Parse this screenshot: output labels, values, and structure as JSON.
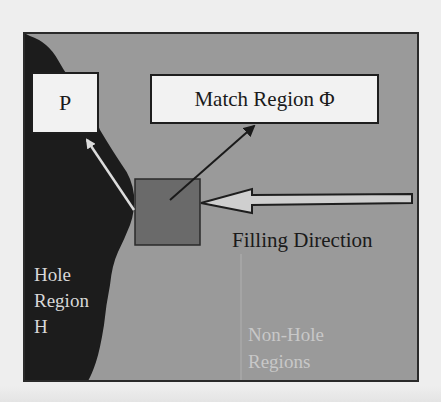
{
  "diagram": {
    "labels": {
      "patch_p": "P",
      "match_region": "Match Region Φ",
      "filling_direction": "Filling Direction",
      "hole_region": [
        "Hole",
        "Region",
        "H"
      ],
      "non_hole_regions": [
        "Non-Hole",
        "Regions"
      ]
    },
    "colors": {
      "page_background": "#eeeeee",
      "non_hole_region": "#9a9a9a",
      "hole_region": "#1c1c1c",
      "patch_square": "#6a6a6a",
      "label_box_fill": "#f2f2f2",
      "frame_border": "#2a2a2a",
      "light_arrow": "#dcdcdc",
      "dark_arrow": "#1a1a1a"
    },
    "arrows": [
      {
        "from": "patch",
        "to": "P",
        "style": "light"
      },
      {
        "from": "patch",
        "to": "Match Region Φ",
        "style": "dark"
      },
      {
        "from": "right edge",
        "to": "patch",
        "label": "Filling Direction",
        "style": "hollow"
      }
    ]
  }
}
